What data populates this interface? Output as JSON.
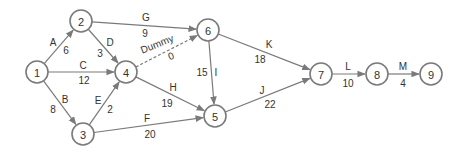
{
  "diagram": {
    "type": "activity-on-arrow network",
    "colors": {
      "stroke": "#7a7a7a",
      "text": "#333333",
      "background": "#ffffff"
    },
    "nodes": [
      {
        "id": "1",
        "label": "1",
        "x": 37,
        "y": 72
      },
      {
        "id": "2",
        "label": "2",
        "x": 81,
        "y": 21
      },
      {
        "id": "3",
        "label": "3",
        "x": 83,
        "y": 134
      },
      {
        "id": "4",
        "label": "4",
        "x": 126,
        "y": 72
      },
      {
        "id": "5",
        "label": "5",
        "x": 215,
        "y": 116
      },
      {
        "id": "6",
        "label": "6",
        "x": 208,
        "y": 30
      },
      {
        "id": "7",
        "label": "7",
        "x": 321,
        "y": 74
      },
      {
        "id": "8",
        "label": "8",
        "x": 377,
        "y": 74
      },
      {
        "id": "9",
        "label": "9",
        "x": 431,
        "y": 74
      }
    ],
    "edges": [
      {
        "activity": "A",
        "duration": "6",
        "from": "1",
        "to": "2",
        "name_pos": [
          53,
          42
        ],
        "dur_pos": [
          66,
          50
        ]
      },
      {
        "activity": "B",
        "duration": "8",
        "from": "1",
        "to": "3",
        "name_pos": [
          65,
          99
        ],
        "dur_pos": [
          53,
          109
        ]
      },
      {
        "activity": "C",
        "duration": "12",
        "from": "1",
        "to": "4",
        "name_pos": [
          83,
          65
        ],
        "dur_pos": [
          84,
          80
        ]
      },
      {
        "activity": "D",
        "duration": "3",
        "from": "2",
        "to": "4",
        "name_pos": [
          110,
          42
        ],
        "dur_pos": [
          100,
          53
        ]
      },
      {
        "activity": "E",
        "duration": "2",
        "from": "3",
        "to": "4",
        "name_pos": [
          98,
          100
        ],
        "dur_pos": [
          110,
          109
        ]
      },
      {
        "activity": "F",
        "duration": "20",
        "from": "3",
        "to": "5",
        "name_pos": [
          147,
          118
        ],
        "dur_pos": [
          150,
          134
        ]
      },
      {
        "activity": "G",
        "duration": "9",
        "from": "2",
        "to": "6",
        "name_pos": [
          146,
          17
        ],
        "dur_pos": [
          145,
          33
        ]
      },
      {
        "activity": "H",
        "duration": "19",
        "from": "4",
        "to": "5",
        "name_pos": [
          173,
          87
        ],
        "dur_pos": [
          167,
          103
        ]
      },
      {
        "activity": "Dummy",
        "duration": "0",
        "from": "4",
        "to": "6",
        "dashed": true,
        "name_pos": [
          157,
          44
        ],
        "dur_pos": [
          171,
          56
        ],
        "rotate": -22
      },
      {
        "activity": "I",
        "duration": "15",
        "from": "6",
        "to": "5",
        "name_pos": [
          216,
          72
        ],
        "dur_pos": [
          202,
          72
        ]
      },
      {
        "activity": "J",
        "duration": "22",
        "from": "5",
        "to": "7",
        "name_pos": [
          262,
          90
        ],
        "dur_pos": [
          270,
          104
        ]
      },
      {
        "activity": "K",
        "duration": "18",
        "from": "6",
        "to": "7",
        "name_pos": [
          269,
          44
        ],
        "dur_pos": [
          260,
          59
        ]
      },
      {
        "activity": "L",
        "duration": "10",
        "from": "7",
        "to": "8",
        "name_pos": [
          348,
          66
        ],
        "dur_pos": [
          348,
          83
        ]
      },
      {
        "activity": "M",
        "duration": "4",
        "from": "8",
        "to": "9",
        "name_pos": [
          403,
          66
        ],
        "dur_pos": [
          403,
          83
        ]
      }
    ],
    "node_radius": 11
  }
}
